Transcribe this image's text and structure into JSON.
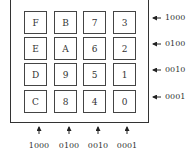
{
  "keypad": {
    "rows": [
      [
        "F",
        "B",
        "7",
        "3"
      ],
      [
        "E",
        "A",
        "6",
        "2"
      ],
      [
        "D",
        "9",
        "5",
        "1"
      ],
      [
        "C",
        "8",
        "4",
        "0"
      ]
    ]
  },
  "row_codes": [
    "1000",
    "0100",
    "0010",
    "0001"
  ],
  "column_codes": [
    "1000",
    "0100",
    "0010",
    "0001"
  ]
}
